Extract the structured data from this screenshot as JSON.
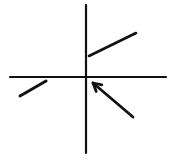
{
  "diagram": {
    "width": 172,
    "height": 165,
    "background": "#ffffff",
    "stroke_color": "#111111",
    "axes": {
      "vertical": {
        "x1": 86,
        "y1": 5,
        "x2": 86,
        "y2": 153,
        "width": 2.2
      },
      "horizontal": {
        "x1": 10,
        "y1": 77,
        "x2": 166,
        "y2": 77,
        "width": 2.2
      }
    },
    "segments": [
      {
        "name": "upper-right-segment",
        "x1": 89,
        "y1": 56,
        "x2": 136,
        "y2": 33,
        "width": 2.6
      },
      {
        "name": "lower-left-segment",
        "x1": 20,
        "y1": 96,
        "x2": 46,
        "y2": 81,
        "width": 3
      }
    ],
    "arrow": {
      "x1": 133,
      "y1": 117,
      "x2": 93,
      "y2": 83,
      "width": 2.8,
      "head": "open"
    }
  }
}
